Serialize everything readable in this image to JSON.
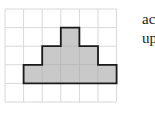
{
  "figure": {
    "grid": {
      "origin_x": 5,
      "origin_y": 9,
      "cell_size": 18.6,
      "columns": 6,
      "rows": 5,
      "line_color": "#d8d8d8"
    },
    "shape": {
      "fill": "#c9c9c9",
      "stroke": "#1a1a1a",
      "cells": [
        [
          3,
          1
        ],
        [
          2,
          2
        ],
        [
          3,
          2
        ],
        [
          4,
          2
        ],
        [
          1,
          3
        ],
        [
          2,
          3
        ],
        [
          3,
          3
        ],
        [
          4,
          3
        ],
        [
          5,
          3
        ]
      ],
      "outline_cells_path": [
        [
          3,
          1
        ],
        [
          4,
          1
        ],
        [
          4,
          2
        ],
        [
          5,
          2
        ],
        [
          5,
          3
        ],
        [
          6,
          3
        ],
        [
          6,
          4
        ],
        [
          1,
          4
        ],
        [
          1,
          3
        ],
        [
          2,
          3
        ],
        [
          2,
          2
        ],
        [
          3,
          2
        ],
        [
          3,
          1
        ]
      ]
    }
  },
  "side_text": {
    "line1": "ac",
    "line2": "up"
  }
}
